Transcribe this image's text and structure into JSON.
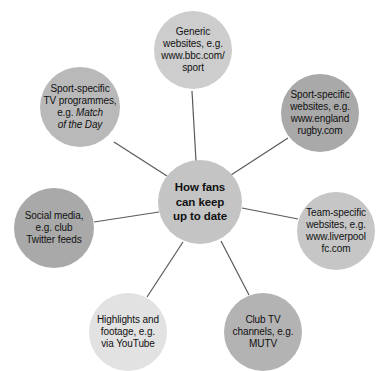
{
  "diagram": {
    "type": "hub-and-spoke",
    "title_node": {
      "name": "hub",
      "text": "How fans can keep up to date",
      "lines": [
        "How fans",
        "can keep",
        "up to date"
      ],
      "fill": "#c4c4c4",
      "cx": 200,
      "cy": 202,
      "d": 84
    },
    "line_color": "#595959",
    "background": "#ffffff",
    "nodes": [
      {
        "id": "generic-websites",
        "lines": [
          "Generic",
          "websites, e.g.",
          "www.bbc.com/",
          "sport"
        ],
        "text": "Generic websites, e.g. www.bbc.com/sport",
        "fill": "#cdcdcd",
        "cx": 193,
        "cy": 50,
        "d": 78,
        "italic_from": -1
      },
      {
        "id": "sport-specific-websites",
        "lines": [
          "Sport-specific",
          "websites, e.g.",
          "www.england",
          "rugby.com"
        ],
        "text": "Sport-specific websites, e.g. www.englandrugby.com",
        "fill": "#a9a9a9",
        "cx": 320,
        "cy": 113,
        "d": 78,
        "italic_from": -1
      },
      {
        "id": "team-specific-websites",
        "lines": [
          "Team-specific",
          "websites, e.g.",
          "www.liverpool",
          "fc.com"
        ],
        "text": "Team-specific websites, e.g. www.liverpoolfc.com",
        "fill": "#c6c6c6",
        "cx": 336,
        "cy": 231,
        "d": 78,
        "italic_from": -1
      },
      {
        "id": "club-tv-channels",
        "lines": [
          "Club TV",
          "channels, e.g.",
          "MUTV"
        ],
        "text": "Club TV channels, e.g. MUTV",
        "fill": "#b3b3b3",
        "cx": 263,
        "cy": 332,
        "d": 78,
        "italic_from": -1
      },
      {
        "id": "highlights-footage",
        "lines": [
          "Highlights and",
          "footage, e.g.",
          "via YouTube"
        ],
        "text": "Highlights and footage, e.g. via YouTube",
        "fill": "#e2e2e2",
        "cx": 128,
        "cy": 332,
        "d": 78,
        "italic_from": -1
      },
      {
        "id": "social-media",
        "lines": [
          "Social media,",
          "e.g. club",
          "Twitter feeds"
        ],
        "text": "Social media, e.g. club Twitter feeds",
        "fill": "#a9a9a9",
        "cx": 54,
        "cy": 228,
        "d": 80,
        "italic_from": -1
      },
      {
        "id": "sport-specific-tv",
        "lines": [
          "Sport-specific",
          "TV programmes,",
          "e.g. Match",
          "of the Day"
        ],
        "text": "Sport-specific TV programmes, e.g. Match of the Day",
        "fill": "#b9b9b9",
        "cx": 80,
        "cy": 107,
        "d": 80,
        "italic_from": 2,
        "italic_split_line": 2,
        "italic_plain_prefix": "e.g. ",
        "italic_part_line2": "Match",
        "italic_part_line3": "of the Day"
      }
    ],
    "spokes": [
      {
        "id": "spoke-generic-websites",
        "x1": 196,
        "y1": 161,
        "x2": 192,
        "y2": 91
      },
      {
        "id": "spoke-sport-specific-websites",
        "x1": 231,
        "y1": 175,
        "x2": 288,
        "y2": 138
      },
      {
        "id": "spoke-team-specific-websites",
        "x1": 242,
        "y1": 208,
        "x2": 298,
        "y2": 219
      },
      {
        "id": "spoke-club-tv-channels",
        "x1": 221,
        "y1": 241,
        "x2": 249,
        "y2": 295
      },
      {
        "id": "spoke-highlights-footage",
        "x1": 183,
        "y1": 242,
        "x2": 147,
        "y2": 297
      },
      {
        "id": "spoke-social-media",
        "x1": 159,
        "y1": 212,
        "x2": 94,
        "y2": 222
      },
      {
        "id": "spoke-sport-specific-tv",
        "x1": 167,
        "y1": 176,
        "x2": 114,
        "y2": 142
      }
    ]
  }
}
